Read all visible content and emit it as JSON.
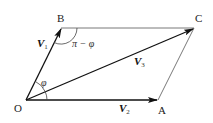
{
  "figure": {
    "type": "vector parallelogram diagram",
    "points": {
      "O": {
        "label": "O",
        "x": 26,
        "y": 100
      },
      "A": {
        "label": "A",
        "x": 158,
        "y": 100
      },
      "B": {
        "label": "B",
        "x": 61,
        "y": 28
      },
      "C": {
        "label": "C",
        "x": 194,
        "y": 28
      }
    },
    "vectors": [
      {
        "name": "V",
        "subscript": "1",
        "from": "O",
        "to": "B"
      },
      {
        "name": "V",
        "subscript": "2",
        "from": "O",
        "to": "A"
      },
      {
        "name": "V",
        "subscript": "3",
        "from": "O",
        "to": "C"
      }
    ],
    "edges": [
      {
        "from": "B",
        "to": "C"
      },
      {
        "from": "A",
        "to": "C"
      }
    ],
    "angles": {
      "at_O": "φ",
      "at_B": "π − φ"
    }
  },
  "labels": {
    "O": "O",
    "A": "A",
    "B": "B",
    "C": "C",
    "v1_main": "V",
    "v1_sub": "1",
    "v2_main": "V",
    "v2_sub": "2",
    "v3_main": "V",
    "v3_sub": "3",
    "phi": "φ",
    "pi_minus_phi": "π − φ"
  }
}
